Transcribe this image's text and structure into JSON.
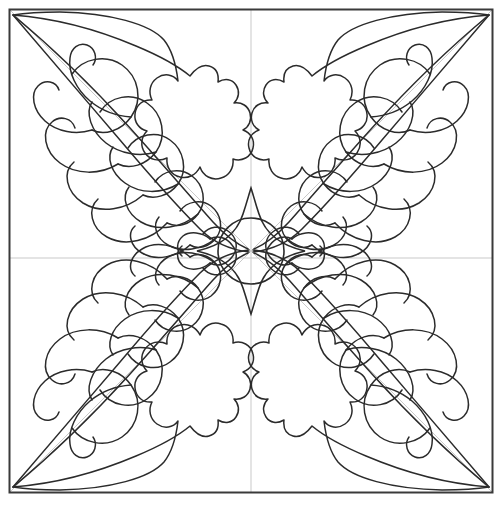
{
  "document": {
    "title": "Feathered Quilting Block Pattern",
    "kind": "line-art-pattern",
    "width": 500,
    "height": 517,
    "background_color": "#ffffff"
  },
  "colors": {
    "background": "#ffffff",
    "ink": "#2b2b2b",
    "frame": "#3a3a3a",
    "guide": "#c9c9c9",
    "page_edge": "#e8e8e8"
  },
  "frame": {
    "name": "outer-square-frame",
    "x": 9,
    "y": 9,
    "width": 484,
    "height": 484,
    "stroke_width": 2,
    "stroke_color": "#3a3a3a",
    "fill": "none"
  },
  "guides": {
    "stroke_color": "#c9c9c9",
    "stroke_width": 1,
    "vertical": {
      "name": "guide-vertical",
      "x": 251,
      "y1": 9,
      "y2": 493
    },
    "horizontal": {
      "name": "guide-horizontal",
      "y": 258,
      "x1": 9,
      "x2": 493
    },
    "diagonal_tlbr": {
      "name": "guide-diagonal-tl-br",
      "x1": 9,
      "y1": 9,
      "x2": 493,
      "y2": 493
    },
    "diagonal_trbl": {
      "name": "guide-diagonal-tr-bl",
      "x1": 493,
      "y1": 9,
      "x2": 9,
      "y2": 493
    }
  },
  "center": {
    "name": "center-medallion",
    "cx": 251,
    "cy": 251,
    "circle_radius": 33,
    "star_points": 4,
    "star_horizontal_reach": 54,
    "star_vertical_reach": 46,
    "stroke_width": 1.6
  },
  "motif": {
    "name": "feathered-plume-quadrant",
    "symmetry": "4-fold mirror + rotation",
    "quadrant_count": 4,
    "plumes_per_quadrant": 6,
    "stroke_width": 1.5,
    "stroke_color": "#2b2b2b",
    "quadrant_labels": [
      "quadrant-top-left",
      "quadrant-top-right",
      "quadrant-bottom-left",
      "quadrant-bottom-right"
    ]
  },
  "geometry": {
    "leaf_outer": "M 12 14 C 60 18 150 46 210 86 C 238 105 250 118 251 125 L 251 125",
    "leaf_spine": "M 12 14 C 60 60 140 150 206 214",
    "plume_sizes": [
      34,
      29,
      24,
      19,
      15,
      11
    ],
    "scroll_count_outer": 3
  }
}
